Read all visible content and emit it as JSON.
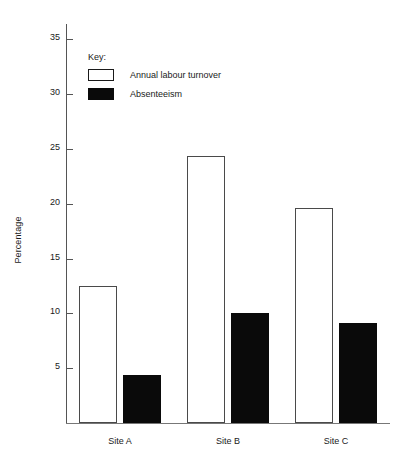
{
  "chart_data": {
    "type": "bar",
    "title": "",
    "subtitle": "",
    "xlabel": "",
    "ylabel": "Percentage",
    "categories": [
      "Site A",
      "Site B",
      "Site C"
    ],
    "series": [
      {
        "name": "Annual labour turnover",
        "style": "open",
        "color": "#ffffff",
        "edge_color": "#4a4a4a",
        "values": [
          12.5,
          24.4,
          19.6
        ]
      },
      {
        "name": "Absenteeism",
        "style": "solid",
        "color": "#0a0a0a",
        "edge_color": "#0a0a0a",
        "values": [
          4.4,
          10.0,
          9.1
        ]
      }
    ],
    "ylim": [
      0,
      36.5
    ],
    "yticks": [
      5,
      10,
      15,
      20,
      25,
      30,
      35
    ],
    "ytick_labels": [
      "5",
      "10",
      "15",
      "20",
      "25",
      "30",
      "35"
    ],
    "grid": false,
    "legend_position": "upper-left-inside",
    "legend_title": "Key:"
  },
  "legend": {
    "title": "Key:",
    "entries": [
      {
        "label": "Annual labour turnover",
        "swatch": "open-square-swatch"
      },
      {
        "label": "Absenteeism",
        "swatch": "filled-square-swatch"
      }
    ]
  },
  "axes": {
    "y_title": "Percentage"
  }
}
